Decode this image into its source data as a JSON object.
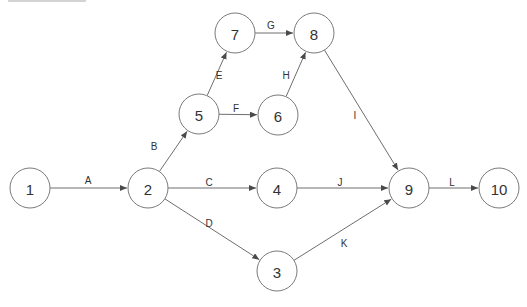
{
  "diagram": {
    "type": "activity-on-arrow network",
    "colors": {
      "stroke": "#7a7a7a",
      "text": "#333333",
      "background": "#ffffff"
    },
    "nodes": [
      {
        "id": "1",
        "label": "1",
        "x": 30,
        "y": 188
      },
      {
        "id": "2",
        "label": "2",
        "x": 148,
        "y": 188
      },
      {
        "id": "3",
        "label": "3",
        "x": 277,
        "y": 271
      },
      {
        "id": "4",
        "label": "4",
        "x": 277,
        "y": 188
      },
      {
        "id": "5",
        "label": "5",
        "x": 199,
        "y": 114
      },
      {
        "id": "6",
        "label": "6",
        "x": 278,
        "y": 115
      },
      {
        "id": "7",
        "label": "7",
        "x": 235,
        "y": 33
      },
      {
        "id": "8",
        "label": "8",
        "x": 314,
        "y": 33
      },
      {
        "id": "9",
        "label": "9",
        "x": 409,
        "y": 188
      },
      {
        "id": "10",
        "label": "10",
        "x": 499,
        "y": 188
      }
    ],
    "edges": [
      {
        "label": "A",
        "from": "1",
        "to": "2",
        "lx": 88,
        "ly": 180
      },
      {
        "label": "B",
        "from": "2",
        "to": "5",
        "lx": 154,
        "ly": 146
      },
      {
        "label": "C",
        "from": "2",
        "to": "4",
        "lx": 209,
        "ly": 182
      },
      {
        "label": "D",
        "from": "2",
        "to": "3",
        "lx": 209,
        "ly": 223
      },
      {
        "label": "E",
        "from": "5",
        "to": "7",
        "lx": 219,
        "ly": 75
      },
      {
        "label": "F",
        "from": "5",
        "to": "6",
        "lx": 236,
        "ly": 108
      },
      {
        "label": "G",
        "from": "7",
        "to": "8",
        "lx": 271,
        "ly": 25
      },
      {
        "label": "H",
        "from": "6",
        "to": "8",
        "lx": 286,
        "ly": 75
      },
      {
        "label": "I",
        "from": "8",
        "to": "9",
        "lx": 355,
        "ly": 115
      },
      {
        "label": "J",
        "from": "4",
        "to": "9",
        "lx": 340,
        "ly": 182
      },
      {
        "label": "K",
        "from": "3",
        "to": "9",
        "lx": 344,
        "ly": 243
      },
      {
        "label": "L",
        "from": "9",
        "to": "10",
        "lx": 452,
        "ly": 182
      }
    ],
    "node_radius": 20
  }
}
